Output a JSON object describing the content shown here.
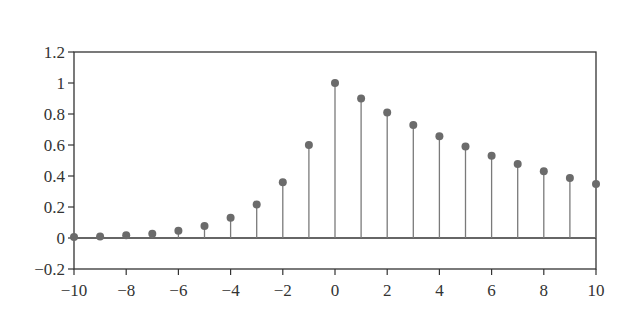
{
  "chart_data": {
    "type": "stem",
    "title": "",
    "xlabel": "",
    "ylabel": "",
    "x": [
      -10,
      -9,
      -8,
      -7,
      -6,
      -5,
      -4,
      -3,
      -2,
      -1,
      0,
      1,
      2,
      3,
      4,
      5,
      6,
      7,
      8,
      9,
      10
    ],
    "values": [
      0.006,
      0.01,
      0.017,
      0.028,
      0.047,
      0.078,
      0.13,
      0.216,
      0.36,
      0.6,
      1.0,
      0.9,
      0.81,
      0.729,
      0.656,
      0.59,
      0.531,
      0.478,
      0.43,
      0.387,
      0.349
    ],
    "xlim": [
      -10,
      10
    ],
    "ylim": [
      -0.2,
      1.2
    ],
    "xticks": [
      -10,
      -8,
      -6,
      -4,
      -2,
      0,
      2,
      4,
      6,
      8,
      10
    ],
    "xtick_labels": [
      "−10",
      "−8",
      "−6",
      "−4",
      "−2",
      "0",
      "2",
      "4",
      "6",
      "8",
      "10"
    ],
    "yticks": [
      -0.2,
      0,
      0.2,
      0.4,
      0.6,
      0.8,
      1,
      1.2
    ],
    "ytick_labels": [
      "−0.2",
      "0",
      "0.2",
      "0.4",
      "0.6",
      "0.8",
      "1",
      "1.2"
    ],
    "grid": false,
    "legend": null,
    "colors": {
      "stem": "#7a7a7a",
      "marker": "#6b6b6b",
      "axis": "#333333",
      "text": "#333333"
    }
  }
}
